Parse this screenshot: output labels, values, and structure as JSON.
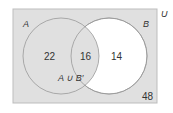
{
  "diagram": {
    "type": "venn",
    "universe_label": "U",
    "sets": [
      {
        "name": "A",
        "label": "A"
      },
      {
        "name": "B",
        "label": "B"
      }
    ],
    "regions": {
      "A_only": "22",
      "A_and_B": "16",
      "B_only": "14",
      "outside": "48"
    },
    "shaded_region_label": "A ∪ B′",
    "colors": {
      "shaded": "#e0e0e0",
      "unshaded": "#ffffff",
      "outline": "#999999",
      "text": "#333333"
    }
  }
}
